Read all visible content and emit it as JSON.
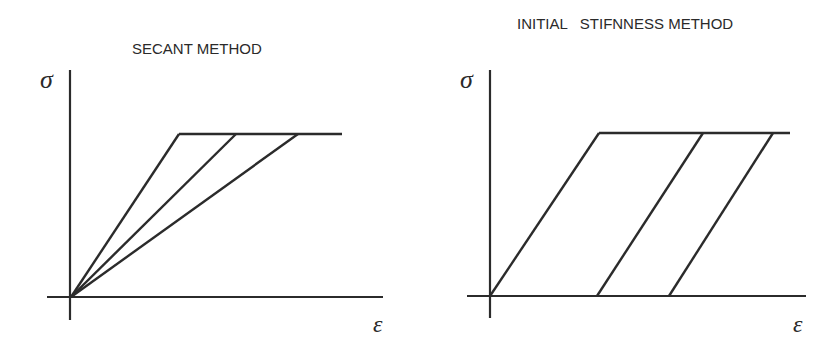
{
  "diagrams": [
    {
      "title": "SECANT METHOD",
      "y_axis_label": "σ",
      "x_axis_label": "ε",
      "origin": [
        71,
        297
      ],
      "plateau_y": 134,
      "plateau_x_range": [
        179,
        342
      ],
      "lines": [
        {
          "from": [
            71,
            297
          ],
          "to": [
            179,
            134
          ]
        },
        {
          "from": [
            71,
            297
          ],
          "to": [
            236,
            134
          ]
        },
        {
          "from": [
            71,
            297
          ],
          "to": [
            298,
            134
          ]
        }
      ]
    },
    {
      "title": "INITIAL   STIFNNESS METHOD",
      "y_axis_label": "σ",
      "x_axis_label": "ε",
      "origin": [
        490,
        296
      ],
      "plateau_y": 133,
      "plateau_x_range": [
        599,
        790
      ],
      "lines": [
        {
          "from": [
            490,
            296
          ],
          "to": [
            599,
            133
          ]
        },
        {
          "from": [
            597,
            296
          ],
          "to": [
            703,
            133
          ]
        },
        {
          "from": [
            669,
            296
          ],
          "to": [
            773,
            133
          ]
        }
      ]
    }
  ],
  "colors": {
    "ink": "#2b2b2b",
    "background": "#ffffff"
  }
}
